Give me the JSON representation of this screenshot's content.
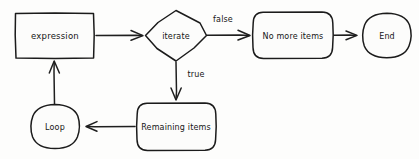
{
  "diagram": {
    "style": "hand-drawn sketch",
    "background_color": "#fdfdfc",
    "ink_color": "#1b1b1b",
    "nodes": [
      {
        "id": "expression",
        "label": "expression",
        "shape": "rectangle"
      },
      {
        "id": "iterate",
        "label": "iterate",
        "shape": "diamond"
      },
      {
        "id": "no_more_items",
        "label": "No more items",
        "shape": "rounded-rectangle"
      },
      {
        "id": "end",
        "label": "End",
        "shape": "ellipse"
      },
      {
        "id": "remaining_items",
        "label": "Remaining items",
        "shape": "rounded-rectangle"
      },
      {
        "id": "loop",
        "label": "Loop",
        "shape": "ellipse"
      }
    ],
    "edges": [
      {
        "id": "e1",
        "from": "expression",
        "to": "iterate",
        "label": ""
      },
      {
        "id": "e2",
        "from": "iterate",
        "to": "no_more_items",
        "label": "false"
      },
      {
        "id": "e3",
        "from": "no_more_items",
        "to": "end",
        "label": ""
      },
      {
        "id": "e4",
        "from": "iterate",
        "to": "remaining_items",
        "label": "true"
      },
      {
        "id": "e5",
        "from": "remaining_items",
        "to": "loop",
        "label": ""
      },
      {
        "id": "e6",
        "from": "loop",
        "to": "expression",
        "label": ""
      }
    ]
  }
}
